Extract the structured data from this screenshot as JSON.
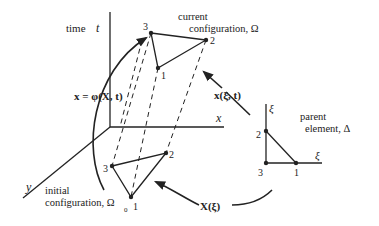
{
  "diagram": {
    "axes": {
      "time_label": "time",
      "time_symbol": "t",
      "x_label": "x",
      "y_label": "y"
    },
    "current_configuration": {
      "line1": "current",
      "line2": "configuration, Ω",
      "nodes": [
        "3",
        "2",
        "1"
      ]
    },
    "initial_configuration": {
      "line1": "initial",
      "line2": "configuration, Ω",
      "subscript": "0",
      "nodes": [
        "3",
        "2",
        "1"
      ]
    },
    "parent_element": {
      "line1": "parent",
      "line2": "element, Δ",
      "xi_axis_label": "ξ",
      "eta_axis_label": "ξ",
      "nodes": [
        "2",
        "3",
        "1"
      ]
    },
    "mappings": {
      "motion": "x = φ(X, t)",
      "current_map": "x(ξ, t)",
      "initial_map": "X(ξ)"
    },
    "colors": {
      "ink": "#222222",
      "background": "#ffffff"
    }
  }
}
